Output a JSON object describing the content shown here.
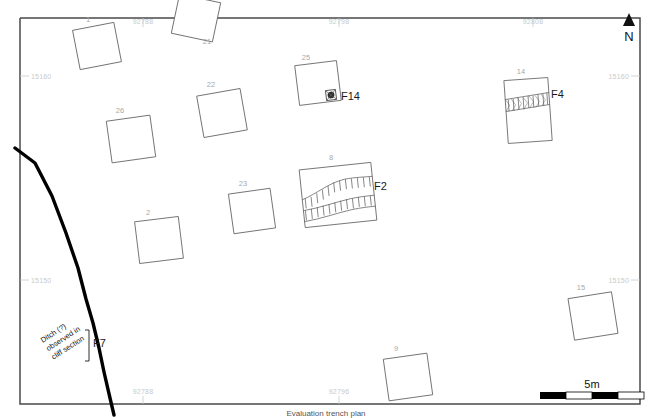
{
  "figure": {
    "type": "archaeological-site-plan",
    "caption": "Evaluation trench plan"
  },
  "north_arrow": {
    "label": "N",
    "icon": "north-arrow-triangle"
  },
  "scale_bar": {
    "label": "5m",
    "segments": 4,
    "total_metres": 5
  },
  "grid_labels": {
    "top": [
      {
        "text": "92788",
        "x": 143,
        "y": 24
      },
      {
        "text": "92798",
        "x": 339,
        "y": 24
      },
      {
        "text": "92808",
        "x": 533,
        "y": 24
      }
    ],
    "left": [
      {
        "text": "15160",
        "x": 40,
        "y": 79
      },
      {
        "text": "15150",
        "x": 40,
        "y": 283
      }
    ],
    "right": [
      {
        "text": "15160",
        "x": 630,
        "y": 79
      },
      {
        "text": "15150",
        "x": 630,
        "y": 283
      }
    ],
    "bottom": [
      {
        "text": "92788",
        "x": 143,
        "y": 394
      },
      {
        "text": "92796",
        "x": 339,
        "y": 394
      }
    ]
  },
  "trenches": [
    {
      "id": "1",
      "label": "1",
      "label_x": 88,
      "label_y": 22,
      "cx": 97,
      "cy": 46,
      "w": 42,
      "h": 40,
      "rot": -11
    },
    {
      "id": "21",
      "label": "21",
      "label_x": 207,
      "label_y": 44,
      "cx": 196,
      "cy": 18,
      "w": 42,
      "h": 40,
      "rot": 12
    },
    {
      "id": "25",
      "label": "25",
      "label_x": 306,
      "label_y": 60,
      "cx": 318,
      "cy": 83,
      "w": 42,
      "h": 40,
      "rot": -7
    },
    {
      "id": "14",
      "label": "14",
      "label_x": 521,
      "label_y": 74,
      "cx": 528,
      "cy": 110,
      "w": 44,
      "h": 63,
      "rot": -4
    },
    {
      "id": "26",
      "label": "26",
      "label_x": 120,
      "label_y": 113,
      "cx": 131,
      "cy": 139,
      "w": 44,
      "h": 42,
      "rot": -8
    },
    {
      "id": "22",
      "label": "22",
      "label_x": 211,
      "label_y": 87,
      "cx": 222,
      "cy": 113,
      "w": 44,
      "h": 42,
      "rot": -10
    },
    {
      "id": "8",
      "label": "8",
      "label_x": 331,
      "label_y": 160,
      "cx": 338,
      "cy": 195,
      "w": 72,
      "h": 58,
      "rot": -6
    },
    {
      "id": "23",
      "label": "23",
      "label_x": 243,
      "label_y": 186,
      "cx": 252,
      "cy": 211,
      "w": 42,
      "h": 40,
      "rot": -8
    },
    {
      "id": "2",
      "label": "2",
      "label_x": 148,
      "label_y": 215,
      "cx": 159,
      "cy": 240,
      "w": 44,
      "h": 42,
      "rot": -7
    },
    {
      "id": "15",
      "label": "15",
      "label_x": 581,
      "label_y": 290,
      "cx": 593,
      "cy": 316,
      "w": 44,
      "h": 42,
      "rot": -9
    },
    {
      "id": "9",
      "label": "9",
      "label_x": 396,
      "label_y": 351,
      "cx": 408,
      "cy": 377,
      "w": 44,
      "h": 42,
      "rot": -8
    }
  ],
  "features": [
    {
      "id": "F14",
      "label": "F14",
      "label_x": 341,
      "label_y": 100,
      "kind": "pit-symbol",
      "trench": "25"
    },
    {
      "id": "F4",
      "label": "F4",
      "label_x": 551,
      "label_y": 98,
      "kind": "hachured-band",
      "trench": "14"
    },
    {
      "id": "F2",
      "label": "F2",
      "label_x": 374,
      "label_y": 190,
      "kind": "hachured-ditch",
      "trench": "8"
    },
    {
      "id": "F7",
      "label": "F7",
      "label_x": 93,
      "label_y": 343,
      "kind": "cliff-ditch",
      "trench": ""
    }
  ],
  "annotations": {
    "ditch_note_lines": [
      "Ditch (?)",
      "observed in",
      "cliff section"
    ],
    "ditch_note_x": 46,
    "ditch_note_y": 348,
    "ditch_note_rotation": -33
  },
  "colors": {
    "frame": "#4a4a4a",
    "trench_outline": "#6e6e6e",
    "trench_label": "#a8a8a8",
    "grid_label": "#c9c9c9",
    "feature_label": "#1a1a1a",
    "cliff_line": "#000000",
    "background": "#ffffff"
  }
}
